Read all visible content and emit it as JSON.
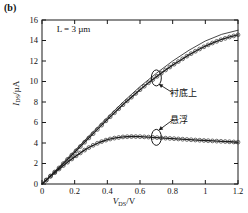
{
  "figure": {
    "panel_label": "(b)",
    "annotation_L": "L = 3 µm"
  },
  "axes": {
    "xlabel_var": "V",
    "xlabel_sub": "DS",
    "xlabel_unit": "/V",
    "ylabel_var": "I",
    "ylabel_sub": "DS",
    "ylabel_unit": "/µA",
    "x_ticks": [
      "0",
      "0.2",
      "0.4",
      "0.6",
      "0.8",
      "1",
      "1.2"
    ],
    "y_ticks": [
      "0",
      "2",
      "4",
      "6",
      "8",
      "10",
      "12",
      "14",
      "16"
    ]
  },
  "annotations": {
    "substrate": "衬底上",
    "suspended": "悬浮"
  },
  "colors": {
    "line": "#1a1a1a",
    "marker_stroke": "#333333",
    "axis": "#1a1a1a",
    "background": "#ffffff"
  },
  "chart_data": {
    "type": "line",
    "title": "(b)",
    "xlabel": "V_DS/V",
    "ylabel": "I_DS/µA",
    "xlim": [
      0,
      1.2
    ],
    "ylim": [
      0,
      16
    ],
    "xticks": [
      0,
      0.2,
      0.4,
      0.6,
      0.8,
      1.0,
      1.2
    ],
    "yticks": [
      0,
      2,
      4,
      6,
      8,
      10,
      12,
      14,
      16
    ],
    "grid": false,
    "legend": "inline-annotations",
    "annotations": [
      {
        "text": "L = 3 µm",
        "x": 0.12,
        "y": 15.0
      },
      {
        "text": "衬底上",
        "x": 0.72,
        "y": 9.1,
        "points_to": [
          0.7,
          10.4
        ]
      },
      {
        "text": "悬浮",
        "x": 0.72,
        "y": 6.4,
        "points_to": [
          0.7,
          4.6
        ]
      }
    ],
    "series": [
      {
        "name": "衬底上",
        "style": "solid-line-with-open-circles",
        "x": [
          0,
          0.05,
          0.1,
          0.15,
          0.2,
          0.25,
          0.3,
          0.35,
          0.4,
          0.45,
          0.5,
          0.55,
          0.6,
          0.65,
          0.7,
          0.75,
          0.8,
          0.85,
          0.9,
          0.95,
          1.0,
          1.05,
          1.1,
          1.15,
          1.2
        ],
        "y": [
          0,
          0.75,
          1.5,
          2.3,
          3.1,
          3.9,
          4.7,
          5.5,
          6.3,
          7.05,
          7.8,
          8.5,
          9.2,
          9.85,
          10.45,
          11.05,
          11.6,
          12.1,
          12.6,
          13.05,
          13.45,
          13.8,
          14.1,
          14.35,
          14.55
        ]
      },
      {
        "name": "衬底上 (model)",
        "style": "thin-solid-line",
        "x": [
          0,
          0.1,
          0.2,
          0.3,
          0.4,
          0.5,
          0.6,
          0.7,
          0.8,
          0.9,
          1.0,
          1.1,
          1.2
        ],
        "y": [
          0,
          1.6,
          3.25,
          4.9,
          6.5,
          8.05,
          9.5,
          10.8,
          12.0,
          13.05,
          13.95,
          14.6,
          15.0
        ]
      },
      {
        "name": "悬浮",
        "style": "solid-line-with-open-circles",
        "x": [
          0,
          0.05,
          0.1,
          0.15,
          0.2,
          0.25,
          0.3,
          0.35,
          0.4,
          0.45,
          0.5,
          0.55,
          0.6,
          0.65,
          0.7,
          0.75,
          0.8,
          0.85,
          0.9,
          0.95,
          1.0,
          1.05,
          1.1,
          1.15,
          1.2
        ],
        "y": [
          0,
          0.72,
          1.4,
          2.05,
          2.65,
          3.2,
          3.68,
          4.05,
          4.33,
          4.5,
          4.6,
          4.63,
          4.62,
          4.58,
          4.53,
          4.48,
          4.43,
          4.38,
          4.33,
          4.28,
          4.24,
          4.2,
          4.16,
          4.12,
          4.08
        ]
      }
    ]
  }
}
